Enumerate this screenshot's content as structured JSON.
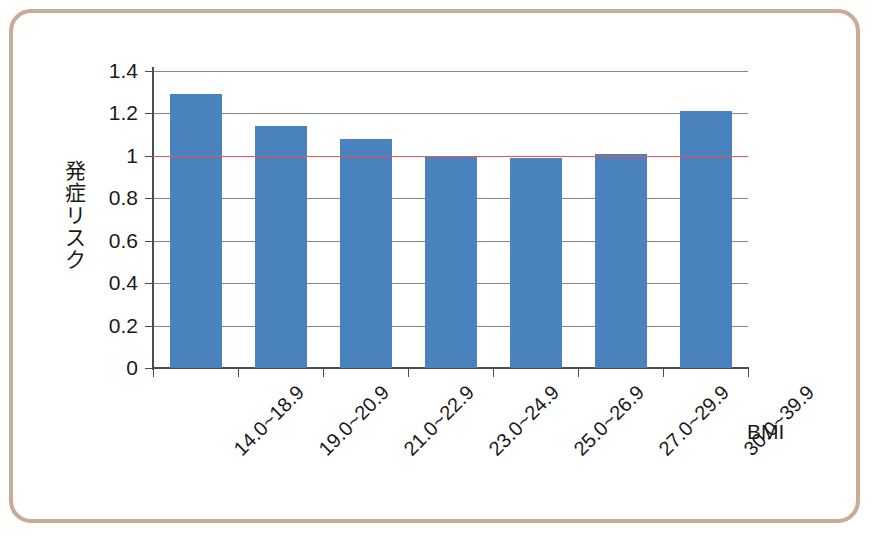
{
  "figure": {
    "frame_color": "#c9ab96",
    "background": "#ffffff"
  },
  "chart_data": {
    "type": "bar",
    "title": "",
    "subtitle": "",
    "xlabel": "BMI",
    "ylabel": "発症リスク",
    "ylabel_chars": [
      "発",
      "症",
      "リ",
      "ス",
      "ク"
    ],
    "categories": [
      "14.0~18.9",
      "19.0~20.9",
      "21.0~22.9",
      "23.0~24.9",
      "25.0~26.9",
      "27.0~29.9",
      "30.0~39.9"
    ],
    "values": [
      1.29,
      1.14,
      1.08,
      1.0,
      0.99,
      1.01,
      1.21
    ],
    "ylim": [
      0,
      1.4
    ],
    "ytick_labels": [
      "0",
      "0.2",
      "0.4",
      "0.6",
      "0.8",
      "1",
      "1.2",
      "1.4"
    ],
    "ytick_values": [
      0,
      0.2,
      0.4,
      0.6,
      0.8,
      1.0,
      1.2,
      1.4
    ],
    "grid": true,
    "grid_color": "#868686",
    "legend": false,
    "legend_position": "none",
    "bar_color": "#4a82be",
    "reference_line": {
      "value": 1.0,
      "color": "#ef5350",
      "label": ""
    },
    "xtick_label_rotation": -45
  }
}
